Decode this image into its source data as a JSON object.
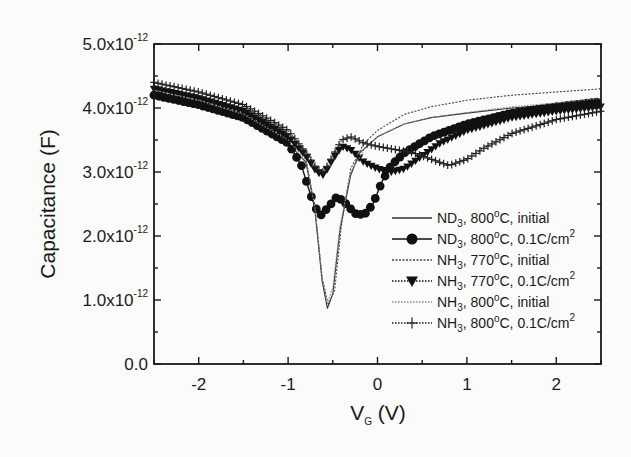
{
  "chart_data": {
    "type": "line",
    "title": "",
    "xlabel": "V_G (V)",
    "xlabel_main": "V",
    "xlabel_sub": "G",
    "xlabel_unit": " (V)",
    "ylabel": "Capacitance (F)",
    "xlim": [
      -2.5,
      2.5
    ],
    "ylim": [
      0.0,
      5e-12
    ],
    "x_ticks": [
      -2,
      -1,
      0,
      1,
      2
    ],
    "x_tick_labels": [
      "-2",
      "-1",
      "0",
      "1",
      "2"
    ],
    "y_ticks": [
      0.0,
      1e-12,
      2e-12,
      3e-12,
      4e-12,
      5e-12
    ],
    "y_tick_labels": [
      {
        "mant": "0.0",
        "exp": ""
      },
      {
        "mant": "1.0x10",
        "exp": "-12"
      },
      {
        "mant": "2.0x10",
        "exp": "-12"
      },
      {
        "mant": "3.0x10",
        "exp": "-12"
      },
      {
        "mant": "4.0x10",
        "exp": "-12"
      },
      {
        "mant": "5.0x10",
        "exp": "-12"
      }
    ],
    "grid": false,
    "legend_position": "lower right (inside plot)",
    "y_unit_scale": "1e-12 F",
    "series": [
      {
        "name": "ND3, 800°C, initial",
        "legend": {
          "gas": "ND",
          "sub": "3",
          "rest1": ", 800",
          "deg": "o",
          "rest2": "C, initial"
        },
        "style": "solid-thin",
        "marker": "none",
        "color": "#333333",
        "x": [
          -2.5,
          -2.0,
          -1.5,
          -1.0,
          -0.8,
          -0.7,
          -0.62,
          -0.56,
          -0.5,
          -0.42,
          -0.3,
          -0.2,
          0.0,
          0.3,
          0.6,
          1.0,
          1.5,
          2.0,
          2.5
        ],
        "y": [
          4.22,
          4.08,
          3.85,
          3.45,
          3.15,
          2.4,
          1.3,
          0.87,
          1.1,
          2.1,
          2.95,
          3.3,
          3.55,
          3.75,
          3.85,
          3.92,
          4.0,
          4.06,
          4.12
        ]
      },
      {
        "name": "ND3, 800°C, 0.1C/cm2",
        "legend": {
          "gas": "ND",
          "sub": "3",
          "rest1": ", 800",
          "deg": "o",
          "rest2": "C, 0.1C/cm",
          "sup2": "2"
        },
        "style": "solid",
        "marker": "circle",
        "color": "#111111",
        "x": [
          -2.5,
          -2.0,
          -1.5,
          -1.0,
          -0.85,
          -0.75,
          -0.65,
          -0.55,
          -0.45,
          -0.35,
          -0.25,
          -0.15,
          -0.05,
          0.05,
          0.15,
          0.3,
          0.6,
          1.0,
          1.5,
          2.0,
          2.5
        ],
        "y": [
          4.2,
          4.05,
          3.85,
          3.45,
          3.1,
          2.65,
          2.3,
          2.45,
          2.62,
          2.5,
          2.35,
          2.33,
          2.5,
          2.85,
          3.1,
          3.3,
          3.55,
          3.75,
          3.92,
          4.02,
          4.1
        ]
      },
      {
        "name": "NH3, 770°C, initial",
        "legend": {
          "gas": "NH",
          "sub": "3",
          "rest1": ", 770",
          "deg": "o",
          "rest2": "C, initial"
        },
        "style": "dashed-fine",
        "marker": "none",
        "color": "#444444",
        "x": [
          -2.5,
          -2.0,
          -1.5,
          -1.0,
          -0.8,
          -0.7,
          -0.62,
          -0.55,
          -0.48,
          -0.4,
          -0.3,
          -0.15,
          0.0,
          0.3,
          0.6,
          1.0,
          1.5,
          2.0,
          2.5
        ],
        "y": [
          4.35,
          4.2,
          3.98,
          3.55,
          3.2,
          2.45,
          1.35,
          0.92,
          1.15,
          2.2,
          3.05,
          3.45,
          3.65,
          3.9,
          4.02,
          4.12,
          4.2,
          4.25,
          4.3
        ]
      },
      {
        "name": "NH3, 770°C, 0.1C/cm2",
        "legend": {
          "gas": "NH",
          "sub": "3",
          "rest1": ", 770",
          "deg": "o",
          "rest2": "C, 0.1C/cm",
          "sup2": "2"
        },
        "style": "dotted",
        "marker": "triangle-down",
        "color": "#111111",
        "x": [
          -2.5,
          -2.0,
          -1.5,
          -1.0,
          -0.8,
          -0.68,
          -0.6,
          -0.5,
          -0.4,
          -0.3,
          -0.15,
          0.0,
          0.15,
          0.3,
          0.45,
          0.7,
          1.0,
          1.5,
          2.0,
          2.5
        ],
        "y": [
          4.3,
          4.15,
          3.95,
          3.55,
          3.25,
          3.0,
          2.95,
          3.2,
          3.4,
          3.35,
          3.15,
          3.05,
          3.0,
          3.05,
          3.2,
          3.45,
          3.65,
          3.85,
          3.95,
          4.02
        ]
      },
      {
        "name": "NH3, 800°C, initial",
        "legend": {
          "gas": "NH",
          "sub": "3",
          "rest1": ", 800",
          "deg": "o",
          "rest2": "C, initial"
        },
        "style": "dotted-grey",
        "marker": "none",
        "color": "#8a8a8a",
        "x": [
          -2.5,
          -2.0,
          -1.5,
          -1.0,
          -0.8,
          -0.7,
          -0.62,
          -0.56,
          -0.5,
          -0.42,
          -0.3,
          -0.15,
          0.0,
          0.3,
          0.6,
          1.0,
          1.5,
          2.0,
          2.5
        ],
        "y": [
          4.28,
          4.12,
          3.9,
          3.5,
          3.18,
          2.45,
          1.35,
          0.95,
          1.2,
          2.15,
          3.0,
          3.35,
          3.55,
          3.75,
          3.85,
          3.93,
          4.02,
          4.08,
          4.15
        ]
      },
      {
        "name": "NH3, 800°C, 0.1C/cm2",
        "legend": {
          "gas": "NH",
          "sub": "3",
          "rest1": ", 800",
          "deg": "o",
          "rest2": "C, 0.1C/cm",
          "sup2": "2"
        },
        "style": "dotted",
        "marker": "cross",
        "color": "#222222",
        "x": [
          -2.5,
          -2.0,
          -1.5,
          -1.0,
          -0.8,
          -0.68,
          -0.6,
          -0.5,
          -0.4,
          -0.3,
          -0.15,
          0.0,
          0.2,
          0.4,
          0.6,
          0.8,
          1.0,
          1.2,
          1.5,
          2.0,
          2.5
        ],
        "y": [
          4.4,
          4.25,
          4.05,
          3.65,
          3.3,
          3.05,
          3.0,
          3.25,
          3.5,
          3.55,
          3.45,
          3.4,
          3.35,
          3.3,
          3.2,
          3.1,
          3.2,
          3.38,
          3.6,
          3.82,
          3.95
        ]
      }
    ]
  },
  "layout": {
    "plot": {
      "left": 154,
      "top": 44,
      "right": 601,
      "bottom": 364
    },
    "colors": {
      "axis": "#1a1a1a",
      "background": "#fbfbfb"
    }
  }
}
